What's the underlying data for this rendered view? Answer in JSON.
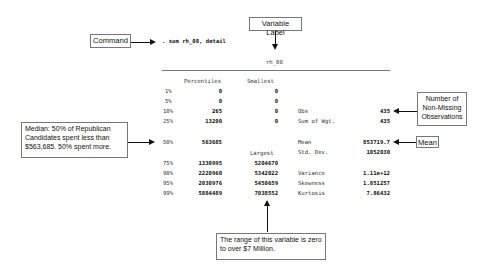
{
  "command": ". sum rh_08, detail",
  "variable_label": "rh_08",
  "headers": {
    "percentiles": "Percentiles",
    "smallest": "Smallest",
    "largest": "Largest"
  },
  "percentile_rows": [
    {
      "pct": "1%",
      "value": "0",
      "extreme": "0"
    },
    {
      "pct": "5%",
      "value": "0",
      "extreme": "0"
    },
    {
      "pct": "10%",
      "value": "265",
      "extreme": "0"
    },
    {
      "pct": "25%",
      "value": "13200",
      "extreme": "0"
    },
    {
      "pct": "50%",
      "value": "563685",
      "extreme": ""
    },
    {
      "pct": "75%",
      "value": "1330995",
      "extreme": "5204670"
    },
    {
      "pct": "90%",
      "value": "2220960",
      "extreme": "5342022"
    },
    {
      "pct": "95%",
      "value": "2030976",
      "extreme": "5450659"
    },
    {
      "pct": "99%",
      "value": "5884489",
      "extreme": "7038552"
    }
  ],
  "stats": {
    "obs_label": "Obs",
    "obs": "435",
    "sumwgt_label": "Sum of Wgt.",
    "sumwgt": "435",
    "mean_label": "Mean",
    "mean": "853719.7",
    "sd_label": "Std. Dev.",
    "sd": "1052030",
    "variance_label": "Variance",
    "variance": "1.11e+12",
    "skewness_label": "Skewness",
    "skewness": "1.851257",
    "kurtosis_label": "Kurtosis",
    "kurtosis": "7.86432"
  },
  "callouts": {
    "command": "Command",
    "variable_label": "Variable Label",
    "nonmissing": "Number of Non-Missing Observations",
    "mean": "Mean",
    "median": "Median:  50% of Republican Candidates spent less than $563,685. 50% spent more.",
    "range": "The range of this variable is zero to over $7 Million."
  }
}
